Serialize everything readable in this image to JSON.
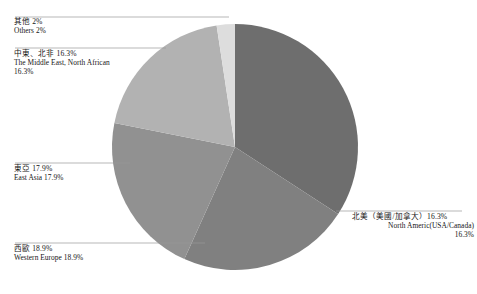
{
  "chart_data": {
    "type": "pie",
    "title": "",
    "subtitle": "",
    "legend_position": "callout-labels",
    "grid": false,
    "categories": [
      "北美（美國/加拿大）",
      "西歐",
      "東亞",
      "中東、北非",
      "其他"
    ],
    "categories_en": [
      "North Americ(USA/Canada)",
      "Western Europe",
      "East Asia",
      "The Middle East, North African",
      "Others"
    ],
    "values": [
      28.6,
      18.9,
      17.9,
      16.3,
      2.0
    ],
    "labeled_values": [
      16.3,
      18.9,
      17.9,
      16.3,
      2.0
    ],
    "value_labels": [
      "16.3%",
      "18.9%",
      "17.9%",
      "16.3%",
      "2%"
    ],
    "colors": [
      "#6e6e6e",
      "#808080",
      "#919191",
      "#b2b2b2",
      "#dddddd"
    ],
    "start_angle_deg": 0,
    "direction": "clockwise",
    "units": "%"
  },
  "slices": [
    {
      "key": "north-america",
      "cn_label": "北美（美國/加拿大）16.3%",
      "en_label_line1": "North Americ(USA/Canada)",
      "en_label_line2": "16.3%",
      "value": 16.3,
      "color": "#6e6e6e"
    },
    {
      "key": "western-europe",
      "cn_label": "西歐 18.9%",
      "en_label_line1": "Western Europe 18.9%",
      "en_label_line2": "",
      "value": 18.9,
      "color": "#808080"
    },
    {
      "key": "east-asia",
      "cn_label": "東亞 17.9%",
      "en_label_line1": "East Asia 17.9%",
      "en_label_line2": "",
      "value": 17.9,
      "color": "#919191"
    },
    {
      "key": "middle-east",
      "cn_label": "中東、北非 16.3%",
      "en_label_line1": "The Middle East, North African",
      "en_label_line2": "16.3%",
      "value": 16.3,
      "color": "#b2b2b2"
    },
    {
      "key": "others",
      "cn_label": "其他 2%",
      "en_label_line1": "Others 2%",
      "en_label_line2": "",
      "value": 2.0,
      "color": "#dddddd"
    }
  ],
  "geometry": {
    "center_x": 235,
    "center_y": 147,
    "radius": 123
  },
  "style": {
    "background": "#ffffff",
    "leader_line_color": "#9a9a9a",
    "text_color": "#161616"
  }
}
